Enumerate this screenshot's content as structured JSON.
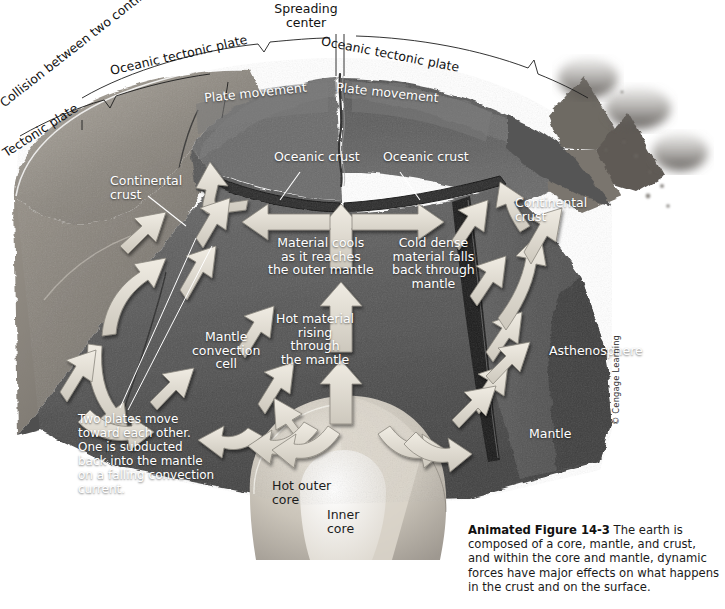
{
  "figure": {
    "number": "Animated Figure 14-3",
    "caption": " The earth is composed of a core, mantle, and crust, and within the core and mantle, dynamic forces have major effects on what happens in the crust and on the surface.",
    "credit": "© Cengage Learning"
  },
  "top_labels": {
    "collision": "Collision between two continents",
    "tectonic_plate": "Tectonic plate",
    "oceanic_tectonic_plate_left": "Oceanic tectonic plate",
    "spreading_center": "Spreading\ncenter",
    "oceanic_tectonic_plate_right": "Oceanic tectonic plate"
  },
  "surface_labels": {
    "plate_movement_left": "Plate movement",
    "plate_movement_right": "Plate movement",
    "oceanic_crust_left": "Oceanic crust",
    "oceanic_crust_right": "Oceanic crust",
    "continental_crust_left": "Continental\ncrust",
    "continental_crust_right": "Continental\ncrust"
  },
  "interior_labels": {
    "material_cools": "Material cools\nas it reaches\nthe outer mantle",
    "cold_dense": "Cold dense\nmaterial falls\nback through\nmantle",
    "hot_material": "Hot material\nrising\nthrough\nthe mantle",
    "mantle_convection_cell": "Mantle\nconvection\ncell",
    "two_plates": "Two plates move\ntoward each other.\nOne is subducted\nback into the mantle\non a falling convection\ncurrent.",
    "asthenosphere": "Asthenosphere",
    "mantle": "Mantle",
    "hot_outer_core": "Hot outer\ncore",
    "inner_core": "Inner\ncore"
  },
  "colors": {
    "background": "#ffffff",
    "crust_light": "#b9b4ad",
    "mantle_mid": "#6f6f6f",
    "mantle_dark": "#4a4a4a",
    "asthenosphere": "#5a5a5a",
    "outer_core": "#cfc9c0",
    "inner_core": "#f2efe9",
    "arrow_fill": "#e2ded4",
    "arrow_edge": "#8d8981",
    "label_light": "#ffffff",
    "label_dark": "#1c1c1c"
  },
  "diagram": {
    "type": "cutaway-cross-section",
    "arrow_count": 26,
    "volcano_count": 3
  }
}
